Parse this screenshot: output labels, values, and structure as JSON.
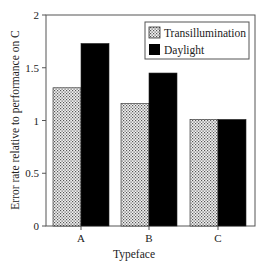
{
  "chart_data": {
    "type": "bar",
    "title": "",
    "xlabel": "Typeface",
    "ylabel": "Error rate relative to performance on C",
    "categories": [
      "A",
      "B",
      "C"
    ],
    "series": [
      {
        "name": "Transillumination",
        "values": [
          1.31,
          1.16,
          1.01
        ],
        "pattern": "dotted",
        "color": "#d8d8d8"
      },
      {
        "name": "Daylight",
        "values": [
          1.73,
          1.45,
          1.01
        ],
        "pattern": "solid",
        "color": "#000000"
      }
    ],
    "ylim": [
      0,
      2
    ],
    "yticks": [
      "0",
      "0.5",
      "1",
      "1.5",
      "2"
    ],
    "grid": false,
    "legend_position": "top-right"
  },
  "legend": {
    "items": [
      "Transillumination",
      "Daylight"
    ]
  }
}
